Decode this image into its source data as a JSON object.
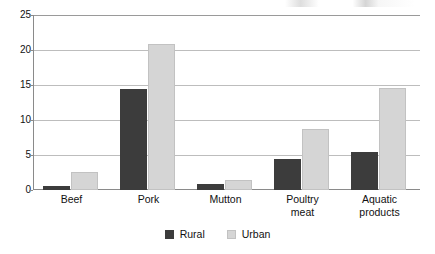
{
  "chart_data": {
    "type": "bar",
    "title": "",
    "subtitle": "",
    "xlabel": "",
    "ylabel": "",
    "categories": [
      "Beef",
      "Pork",
      "Mutton",
      "Poultry\nmeat",
      "Aquatic\nproducts"
    ],
    "series": [
      {
        "name": "Rural",
        "color": "#3c3c3c",
        "values": [
          0.6,
          14.4,
          0.9,
          4.4,
          5.4
        ]
      },
      {
        "name": "Urban",
        "color": "#d5d5d5",
        "values": [
          2.6,
          20.8,
          1.4,
          8.7,
          14.6
        ]
      }
    ],
    "ylim": [
      0,
      25
    ],
    "yticks": [
      0,
      5,
      10,
      15,
      20,
      25
    ],
    "ytick_labels": [
      "0",
      "5",
      "10",
      "15",
      "20",
      "25"
    ],
    "grid": true,
    "grid_axis": "y",
    "legend_position": "bottom-center",
    "annotations": []
  },
  "legend": {
    "items": [
      {
        "label": "Rural",
        "swatch": "rural"
      },
      {
        "label": "Urban",
        "swatch": "urban"
      }
    ]
  }
}
